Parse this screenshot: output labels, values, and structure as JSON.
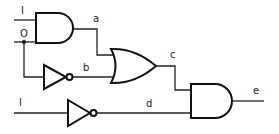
{
  "diagram": {
    "type": "logic-circuit",
    "inputs": [
      {
        "id": "in1",
        "label": "I"
      },
      {
        "id": "in0",
        "label": "O"
      },
      {
        "id": "in3",
        "label": "I"
      }
    ],
    "signals": {
      "a": "a",
      "b": "b",
      "c": "c",
      "d": "d",
      "e": "e"
    },
    "gates": [
      {
        "id": "and1",
        "type": "AND",
        "inputs": [
          "I",
          "O"
        ],
        "output": "a"
      },
      {
        "id": "not1",
        "type": "NOT",
        "inputs": [
          "O"
        ],
        "output": "b"
      },
      {
        "id": "or1",
        "type": "OR",
        "inputs": [
          "a",
          "b"
        ],
        "output": "c"
      },
      {
        "id": "not2",
        "type": "NOT",
        "inputs": [
          "I"
        ],
        "output": "d"
      },
      {
        "id": "and2",
        "type": "AND",
        "inputs": [
          "c",
          "d"
        ],
        "output": "e"
      }
    ]
  }
}
